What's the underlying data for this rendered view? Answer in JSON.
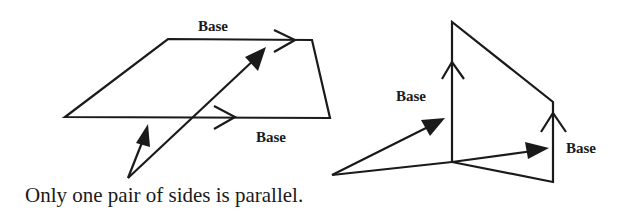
{
  "figure": {
    "left_shape": {
      "name": "trapezoid",
      "top_base_label": "Base",
      "bottom_base_label": "Base"
    },
    "right_shape": {
      "name": "trapezoid-perspective",
      "left_base_label": "Base",
      "right_base_label": "Base"
    },
    "caption": "Only one pair of sides is parallel.",
    "colors": {
      "stroke": "#1a1a1a",
      "background": "#ffffff"
    }
  }
}
